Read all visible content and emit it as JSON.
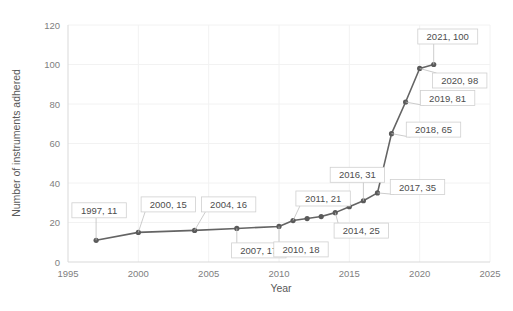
{
  "chart_data": {
    "type": "line",
    "title": "",
    "xlabel": "Year",
    "ylabel": "Number of instruments adhered",
    "xlim": [
      1995,
      2025
    ],
    "ylim": [
      0,
      120
    ],
    "xticks": [
      1995,
      2000,
      2005,
      2010,
      2015,
      2020,
      2025
    ],
    "yticks": [
      0,
      20,
      40,
      60,
      80,
      100,
      120
    ],
    "grid": true,
    "legend": false,
    "line_color": "#646464",
    "marker_color": "#5a5a5a",
    "gridline_color": "#f2f2f2",
    "x": [
      1997,
      2000,
      2004,
      2007,
      2010,
      2011,
      2012,
      2013,
      2014,
      2015,
      2016,
      2017,
      2018,
      2019,
      2020,
      2021
    ],
    "values": [
      11,
      15,
      16,
      17,
      18,
      21,
      22,
      23,
      25,
      28,
      31,
      35,
      65,
      81,
      98,
      100
    ],
    "labeled_points": [
      {
        "x": 1997,
        "y": 11,
        "text": "1997, 11"
      },
      {
        "x": 2000,
        "y": 15,
        "text": "2000, 15"
      },
      {
        "x": 2004,
        "y": 16,
        "text": "2004, 16"
      },
      {
        "x": 2007,
        "y": 17,
        "text": "2007, 17"
      },
      {
        "x": 2010,
        "y": 18,
        "text": "2010, 18"
      },
      {
        "x": 2011,
        "y": 21,
        "text": "2011, 21"
      },
      {
        "x": 2014,
        "y": 25,
        "text": "2014, 25"
      },
      {
        "x": 2016,
        "y": 31,
        "text": "2016, 31"
      },
      {
        "x": 2017,
        "y": 35,
        "text": "2017, 35"
      },
      {
        "x": 2018,
        "y": 65,
        "text": "2018, 65"
      },
      {
        "x": 2019,
        "y": 81,
        "text": "2019, 81"
      },
      {
        "x": 2020,
        "y": 98,
        "text": "2020, 98"
      },
      {
        "x": 2021,
        "y": 100,
        "text": "2021, 100"
      }
    ]
  },
  "axis": {
    "x_tick_labels": [
      "1995",
      "2000",
      "2005",
      "2010",
      "2015",
      "2020",
      "2025"
    ],
    "y_tick_labels": [
      "0",
      "20",
      "40",
      "60",
      "80",
      "100",
      "120"
    ],
    "x_title": "Year",
    "y_title": "Number of instruments adhered"
  },
  "data_labels": [
    "1997, 11",
    "2000, 15",
    "2004, 16",
    "2007, 17",
    "2010, 18",
    "2011, 21",
    "2014, 25",
    "2016, 31",
    "2017, 35",
    "2018, 65",
    "2019, 81",
    "2020, 98",
    "2021, 100"
  ]
}
